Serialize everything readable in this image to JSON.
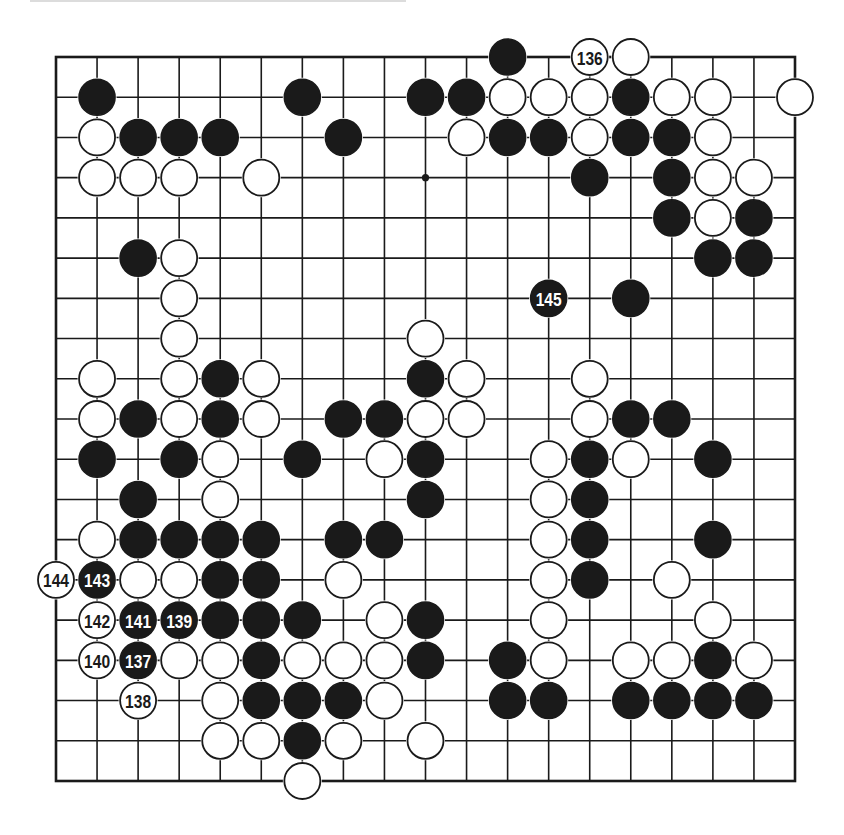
{
  "diagram": {
    "board_size": 19,
    "star_points": [
      [
        3,
        9
      ]
    ],
    "colors": {
      "black": "#1a1a1a",
      "white": "#ffffff",
      "line": "#1a1a1a",
      "background": "#ffffff"
    },
    "stones": [
      {
        "row": 0,
        "col": 11,
        "color": "black"
      },
      {
        "row": 0,
        "col": 13,
        "color": "white",
        "label": "136"
      },
      {
        "row": 0,
        "col": 14,
        "color": "white"
      },
      {
        "row": 1,
        "col": 1,
        "color": "black"
      },
      {
        "row": 1,
        "col": 6,
        "color": "black"
      },
      {
        "row": 1,
        "col": 9,
        "color": "black"
      },
      {
        "row": 1,
        "col": 10,
        "color": "black"
      },
      {
        "row": 1,
        "col": 11,
        "color": "white"
      },
      {
        "row": 1,
        "col": 12,
        "color": "white"
      },
      {
        "row": 1,
        "col": 13,
        "color": "white"
      },
      {
        "row": 1,
        "col": 14,
        "color": "black"
      },
      {
        "row": 1,
        "col": 15,
        "color": "white"
      },
      {
        "row": 1,
        "col": 16,
        "color": "white"
      },
      {
        "row": 1,
        "col": 18,
        "color": "white"
      },
      {
        "row": 2,
        "col": 1,
        "color": "white"
      },
      {
        "row": 2,
        "col": 2,
        "color": "black"
      },
      {
        "row": 2,
        "col": 3,
        "color": "black"
      },
      {
        "row": 2,
        "col": 4,
        "color": "black"
      },
      {
        "row": 2,
        "col": 7,
        "color": "black"
      },
      {
        "row": 2,
        "col": 10,
        "color": "white"
      },
      {
        "row": 2,
        "col": 11,
        "color": "black"
      },
      {
        "row": 2,
        "col": 12,
        "color": "black"
      },
      {
        "row": 2,
        "col": 13,
        "color": "white"
      },
      {
        "row": 2,
        "col": 14,
        "color": "black"
      },
      {
        "row": 2,
        "col": 15,
        "color": "black"
      },
      {
        "row": 2,
        "col": 16,
        "color": "white"
      },
      {
        "row": 3,
        "col": 1,
        "color": "white"
      },
      {
        "row": 3,
        "col": 2,
        "color": "white"
      },
      {
        "row": 3,
        "col": 3,
        "color": "white"
      },
      {
        "row": 3,
        "col": 5,
        "color": "white"
      },
      {
        "row": 3,
        "col": 13,
        "color": "black"
      },
      {
        "row": 3,
        "col": 15,
        "color": "black"
      },
      {
        "row": 3,
        "col": 16,
        "color": "white"
      },
      {
        "row": 3,
        "col": 17,
        "color": "white"
      },
      {
        "row": 4,
        "col": 15,
        "color": "black"
      },
      {
        "row": 4,
        "col": 16,
        "color": "white"
      },
      {
        "row": 4,
        "col": 17,
        "color": "black"
      },
      {
        "row": 5,
        "col": 2,
        "color": "black"
      },
      {
        "row": 5,
        "col": 3,
        "color": "white"
      },
      {
        "row": 5,
        "col": 16,
        "color": "black"
      },
      {
        "row": 5,
        "col": 17,
        "color": "black"
      },
      {
        "row": 6,
        "col": 3,
        "color": "white"
      },
      {
        "row": 6,
        "col": 12,
        "color": "black",
        "label": "145"
      },
      {
        "row": 6,
        "col": 14,
        "color": "black"
      },
      {
        "row": 7,
        "col": 3,
        "color": "white"
      },
      {
        "row": 7,
        "col": 9,
        "color": "white"
      },
      {
        "row": 8,
        "col": 1,
        "color": "white"
      },
      {
        "row": 8,
        "col": 3,
        "color": "white"
      },
      {
        "row": 8,
        "col": 4,
        "color": "black"
      },
      {
        "row": 8,
        "col": 5,
        "color": "white"
      },
      {
        "row": 8,
        "col": 9,
        "color": "black"
      },
      {
        "row": 8,
        "col": 10,
        "color": "white"
      },
      {
        "row": 8,
        "col": 13,
        "color": "white"
      },
      {
        "row": 9,
        "col": 1,
        "color": "white"
      },
      {
        "row": 9,
        "col": 2,
        "color": "black"
      },
      {
        "row": 9,
        "col": 3,
        "color": "white"
      },
      {
        "row": 9,
        "col": 4,
        "color": "black"
      },
      {
        "row": 9,
        "col": 5,
        "color": "white"
      },
      {
        "row": 9,
        "col": 7,
        "color": "black"
      },
      {
        "row": 9,
        "col": 8,
        "color": "black"
      },
      {
        "row": 9,
        "col": 9,
        "color": "white"
      },
      {
        "row": 9,
        "col": 10,
        "color": "white"
      },
      {
        "row": 9,
        "col": 13,
        "color": "white"
      },
      {
        "row": 9,
        "col": 14,
        "color": "black"
      },
      {
        "row": 9,
        "col": 15,
        "color": "black"
      },
      {
        "row": 10,
        "col": 1,
        "color": "black"
      },
      {
        "row": 10,
        "col": 3,
        "color": "black"
      },
      {
        "row": 10,
        "col": 4,
        "color": "white"
      },
      {
        "row": 10,
        "col": 6,
        "color": "black"
      },
      {
        "row": 10,
        "col": 8,
        "color": "white"
      },
      {
        "row": 10,
        "col": 9,
        "color": "black"
      },
      {
        "row": 10,
        "col": 12,
        "color": "white"
      },
      {
        "row": 10,
        "col": 13,
        "color": "black"
      },
      {
        "row": 10,
        "col": 14,
        "color": "white"
      },
      {
        "row": 10,
        "col": 16,
        "color": "black"
      },
      {
        "row": 11,
        "col": 2,
        "color": "black"
      },
      {
        "row": 11,
        "col": 4,
        "color": "white"
      },
      {
        "row": 11,
        "col": 9,
        "color": "black"
      },
      {
        "row": 11,
        "col": 12,
        "color": "white"
      },
      {
        "row": 11,
        "col": 13,
        "color": "black"
      },
      {
        "row": 12,
        "col": 1,
        "color": "white"
      },
      {
        "row": 12,
        "col": 2,
        "color": "black"
      },
      {
        "row": 12,
        "col": 3,
        "color": "black"
      },
      {
        "row": 12,
        "col": 4,
        "color": "black"
      },
      {
        "row": 12,
        "col": 5,
        "color": "black"
      },
      {
        "row": 12,
        "col": 7,
        "color": "black"
      },
      {
        "row": 12,
        "col": 8,
        "color": "black"
      },
      {
        "row": 12,
        "col": 12,
        "color": "white"
      },
      {
        "row": 12,
        "col": 13,
        "color": "black"
      },
      {
        "row": 12,
        "col": 16,
        "color": "black"
      },
      {
        "row": 13,
        "col": 0,
        "color": "white",
        "label": "144"
      },
      {
        "row": 13,
        "col": 1,
        "color": "black",
        "label": "143"
      },
      {
        "row": 13,
        "col": 2,
        "color": "white"
      },
      {
        "row": 13,
        "col": 3,
        "color": "white"
      },
      {
        "row": 13,
        "col": 4,
        "color": "black"
      },
      {
        "row": 13,
        "col": 5,
        "color": "black"
      },
      {
        "row": 13,
        "col": 7,
        "color": "white"
      },
      {
        "row": 13,
        "col": 12,
        "color": "white"
      },
      {
        "row": 13,
        "col": 13,
        "color": "black"
      },
      {
        "row": 13,
        "col": 15,
        "color": "white"
      },
      {
        "row": 14,
        "col": 1,
        "color": "white",
        "label": "142"
      },
      {
        "row": 14,
        "col": 2,
        "color": "black",
        "label": "141"
      },
      {
        "row": 14,
        "col": 3,
        "color": "black",
        "label": "139"
      },
      {
        "row": 14,
        "col": 4,
        "color": "black"
      },
      {
        "row": 14,
        "col": 5,
        "color": "black"
      },
      {
        "row": 14,
        "col": 6,
        "color": "black"
      },
      {
        "row": 14,
        "col": 8,
        "color": "white"
      },
      {
        "row": 14,
        "col": 9,
        "color": "black"
      },
      {
        "row": 14,
        "col": 12,
        "color": "white"
      },
      {
        "row": 14,
        "col": 16,
        "color": "white"
      },
      {
        "row": 15,
        "col": 1,
        "color": "white",
        "label": "140"
      },
      {
        "row": 15,
        "col": 2,
        "color": "black",
        "label": "137"
      },
      {
        "row": 15,
        "col": 3,
        "color": "white"
      },
      {
        "row": 15,
        "col": 4,
        "color": "white"
      },
      {
        "row": 15,
        "col": 5,
        "color": "black"
      },
      {
        "row": 15,
        "col": 6,
        "color": "white"
      },
      {
        "row": 15,
        "col": 7,
        "color": "white"
      },
      {
        "row": 15,
        "col": 8,
        "color": "white"
      },
      {
        "row": 15,
        "col": 9,
        "color": "black"
      },
      {
        "row": 15,
        "col": 11,
        "color": "black"
      },
      {
        "row": 15,
        "col": 12,
        "color": "white"
      },
      {
        "row": 15,
        "col": 14,
        "color": "white"
      },
      {
        "row": 15,
        "col": 15,
        "color": "white"
      },
      {
        "row": 15,
        "col": 16,
        "color": "black"
      },
      {
        "row": 15,
        "col": 17,
        "color": "white"
      },
      {
        "row": 16,
        "col": 2,
        "color": "white",
        "label": "138"
      },
      {
        "row": 16,
        "col": 4,
        "color": "white"
      },
      {
        "row": 16,
        "col": 5,
        "color": "black"
      },
      {
        "row": 16,
        "col": 6,
        "color": "black"
      },
      {
        "row": 16,
        "col": 7,
        "color": "black"
      },
      {
        "row": 16,
        "col": 8,
        "color": "white"
      },
      {
        "row": 16,
        "col": 11,
        "color": "black"
      },
      {
        "row": 16,
        "col": 12,
        "color": "black"
      },
      {
        "row": 16,
        "col": 14,
        "color": "black"
      },
      {
        "row": 16,
        "col": 15,
        "color": "black"
      },
      {
        "row": 16,
        "col": 16,
        "color": "black"
      },
      {
        "row": 16,
        "col": 17,
        "color": "black"
      },
      {
        "row": 17,
        "col": 4,
        "color": "white"
      },
      {
        "row": 17,
        "col": 5,
        "color": "white"
      },
      {
        "row": 17,
        "col": 6,
        "color": "black"
      },
      {
        "row": 17,
        "col": 7,
        "color": "white"
      },
      {
        "row": 17,
        "col": 9,
        "color": "white"
      },
      {
        "row": 18,
        "col": 6,
        "color": "white"
      }
    ]
  }
}
